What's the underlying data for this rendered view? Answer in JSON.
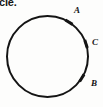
{
  "figure": {
    "caption_fragment": "cle.",
    "background_color": "#fdfdfc",
    "ink_color": "#141414"
  },
  "diagram": {
    "type": "circle-with-marked-points",
    "circle": {
      "center_x": 47.5,
      "center_y": 56.5,
      "radius": 40.5,
      "stroke_width": 2.0,
      "stroke_color": "#141414",
      "fill": "none"
    },
    "points": [
      {
        "id": "A",
        "label": "A",
        "label_x": 74,
        "label_y": 6,
        "tick_angle_deg": -58,
        "tick_x": 69.0,
        "tick_y": 22.2
      },
      {
        "id": "C",
        "label": "C",
        "label_x": 92,
        "label_y": 38,
        "tick_angle_deg": -18,
        "tick_x": 86.0,
        "tick_y": 44.0
      },
      {
        "id": "B",
        "label": "B",
        "label_x": 91,
        "label_y": 79,
        "tick_angle_deg": 32,
        "tick_x": 81.8,
        "tick_y": 78.0
      }
    ]
  }
}
